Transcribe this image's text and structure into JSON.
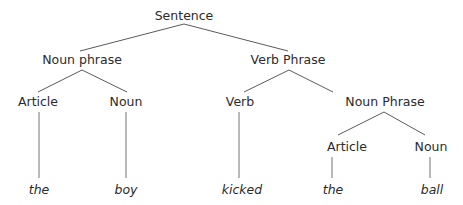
{
  "diagram": {
    "type": "syntax-tree",
    "root": {
      "label": "Sentence",
      "children": [
        {
          "label": "Noun phrase",
          "children": [
            {
              "label": "Article",
              "children": [
                {
                  "label": "the",
                  "leaf": true
                }
              ]
            },
            {
              "label": "Noun",
              "children": [
                {
                  "label": "boy",
                  "leaf": true
                }
              ]
            }
          ]
        },
        {
          "label": "Verb Phrase",
          "children": [
            {
              "label": "Verb",
              "children": [
                {
                  "label": "kicked",
                  "leaf": true
                }
              ]
            },
            {
              "label": "Noun Phrase",
              "children": [
                {
                  "label": "Article",
                  "children": [
                    {
                      "label": "the",
                      "leaf": true
                    }
                  ]
                },
                {
                  "label": "Noun",
                  "children": [
                    {
                      "label": "ball",
                      "leaf": true
                    }
                  ]
                }
              ]
            }
          ]
        }
      ]
    },
    "nodes": {
      "sentence": "Sentence",
      "noun_phrase": "Noun phrase",
      "verb_phrase": "Verb Phrase",
      "article_1": "Article",
      "noun_1": "Noun",
      "verb": "Verb",
      "noun_phrase_2": "Noun Phrase",
      "article_2": "Article",
      "noun_2": "Noun"
    },
    "leaves": [
      "the",
      "boy",
      "kicked",
      "the",
      "ball"
    ],
    "colors": {
      "text": "#2b2b2b",
      "edge": "#5a5a5a",
      "leaf_edge": "#8a8a8a",
      "background": "#ffffff"
    }
  }
}
